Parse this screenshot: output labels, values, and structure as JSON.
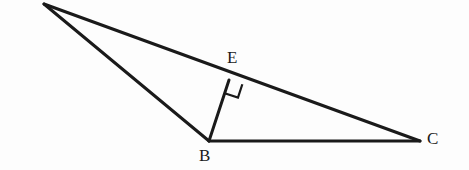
{
  "figure": {
    "type": "geometry-diagram",
    "canvas": {
      "width": 469,
      "height": 170
    },
    "background_color": "#fdfdfd",
    "stroke_color": "#1a1a1a",
    "stroke_width": 3,
    "points": {
      "A": {
        "x": 44,
        "y": 4,
        "label": "",
        "labeled": false
      },
      "B": {
        "x": 209,
        "y": 141,
        "label": "B",
        "labeled": true
      },
      "C": {
        "x": 420,
        "y": 141,
        "label": "C",
        "labeled": true
      },
      "E": {
        "x": 229,
        "y": 80,
        "label": "E",
        "labeled": true
      }
    },
    "segments": [
      {
        "name": "AB",
        "from": "A",
        "to": "B"
      },
      {
        "name": "AC",
        "from": "A",
        "to": "C"
      },
      {
        "name": "BC",
        "from": "B",
        "to": "C"
      },
      {
        "name": "BE",
        "from": "B",
        "to": "E"
      }
    ],
    "right_angle": {
      "at": "E",
      "between": [
        "EB",
        "EC"
      ],
      "marker": "square",
      "size": 14
    },
    "labels": {
      "B": "B",
      "C": "C",
      "E": "E"
    }
  }
}
